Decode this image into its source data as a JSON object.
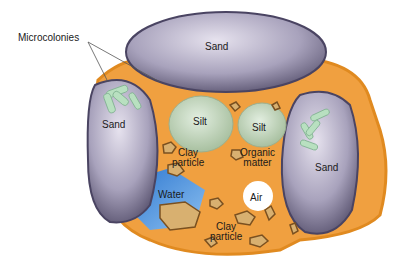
{
  "diagram": {
    "labels": {
      "microcolonies": "Microcolonies",
      "sand_top": "Sand",
      "sand_left": "Sand",
      "sand_right": "Sand",
      "silt_1": "Silt",
      "silt_2": "Silt",
      "clay_1": "Clay\nparticle",
      "organic": "Organic\nmatter",
      "water": "Water",
      "air": "Air",
      "clay_2": "Clay\nparticle"
    },
    "colors": {
      "matrix": "#f0a040",
      "matrix_edge": "#e08a20",
      "sand": "#a09ab8",
      "silt": "#c8d8c0",
      "water": "#4a90d8",
      "bacteria": "#b8e0c0"
    }
  }
}
